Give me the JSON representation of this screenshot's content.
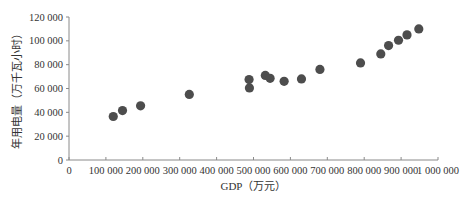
{
  "chart_data": {
    "type": "scatter",
    "title": "",
    "xlabel": "GDP（万元）",
    "ylabel": "年用电量（万千瓦小时）",
    "xlim": [
      0,
      1000000
    ],
    "ylim": [
      0,
      120000
    ],
    "grid": false,
    "legend": null,
    "x_ticks": [
      0,
      100000,
      200000,
      300000,
      400000,
      500000,
      600000,
      700000,
      800000,
      900000,
      1000000
    ],
    "x_tick_labels": [
      "0",
      "100 000",
      "200 000",
      "300 000",
      "400 000",
      "500 000",
      "600 000",
      "700 000",
      "800 000",
      "900 000",
      "1 000 000"
    ],
    "y_ticks": [
      0,
      20000,
      40000,
      60000,
      80000,
      100000,
      120000
    ],
    "y_tick_labels": [
      "0",
      "20 000",
      "40 000",
      "60 000",
      "80 000",
      "100 000",
      "120 000"
    ],
    "series": [
      {
        "name": "年用电量",
        "color": "#4d4d4d",
        "points": [
          {
            "x": 120000,
            "y": 36500
          },
          {
            "x": 145000,
            "y": 41500
          },
          {
            "x": 194000,
            "y": 45500
          },
          {
            "x": 326000,
            "y": 55000
          },
          {
            "x": 488000,
            "y": 67500
          },
          {
            "x": 489000,
            "y": 60500
          },
          {
            "x": 532000,
            "y": 71000
          },
          {
            "x": 545000,
            "y": 68500
          },
          {
            "x": 583000,
            "y": 66000
          },
          {
            "x": 630000,
            "y": 68000
          },
          {
            "x": 680000,
            "y": 76000
          },
          {
            "x": 790000,
            "y": 81500
          },
          {
            "x": 845000,
            "y": 89000
          },
          {
            "x": 866000,
            "y": 96000
          },
          {
            "x": 893000,
            "y": 100500
          },
          {
            "x": 916000,
            "y": 105000
          },
          {
            "x": 948000,
            "y": 110000
          }
        ]
      }
    ]
  },
  "layout": {
    "plot_left": 69,
    "plot_right": 438,
    "plot_top": 17,
    "plot_bottom": 160,
    "point_radius": 4.6
  }
}
